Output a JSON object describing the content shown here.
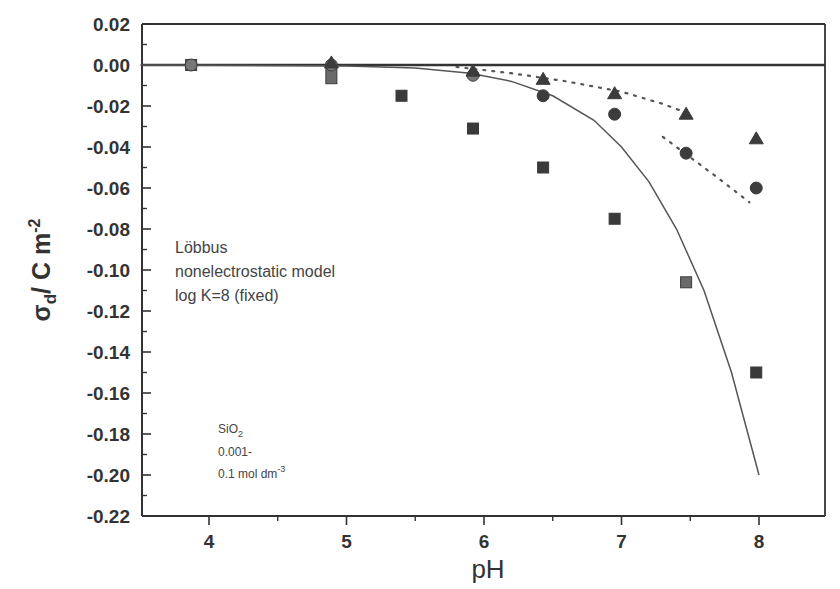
{
  "chart_data": {
    "type": "scatter",
    "title": "",
    "xlabel": "pH",
    "ylabel": "σd / C m-2",
    "ylabel_parts": {
      "sigma": "σ",
      "sub": "d",
      "unit": "/ C m",
      "sup": "-2"
    },
    "xlim": [
      3.5,
      8.5
    ],
    "ylim": [
      -0.22,
      0.02
    ],
    "grid": false,
    "x_ticks": [
      4,
      5,
      6,
      7,
      8
    ],
    "x_tick_labels": [
      "4",
      "5",
      "6",
      "7",
      "8"
    ],
    "y_ticks": [
      0.02,
      0.0,
      -0.02,
      -0.04,
      -0.06,
      -0.08,
      -0.1,
      -0.12,
      -0.14,
      -0.16,
      -0.18,
      -0.2,
      -0.22
    ],
    "y_tick_labels": [
      "0.02",
      "0.00",
      "-0.02",
      "-0.04",
      "-0.06",
      "-0.08",
      "-0.10",
      "-0.12",
      "-0.14",
      "-0.16",
      "-0.18",
      "-0.20",
      "-0.22"
    ],
    "annotations": [
      {
        "lines": [
          "Löbbus",
          "nonelectrostatic model",
          "log K=8 (fixed)"
        ]
      },
      {
        "lines": [
          "SiO2",
          "0.001-",
          "0.1 mol dm-3"
        ]
      }
    ],
    "series": [
      {
        "name": "squares (highest concentration)",
        "marker": "square",
        "x": [
          3.87,
          4.89,
          5.4,
          5.92,
          6.43,
          6.95,
          7.47,
          7.98
        ],
        "y": [
          0.0,
          -0.004,
          -0.015,
          -0.031,
          -0.05,
          -0.075,
          -0.106,
          -0.15
        ]
      },
      {
        "name": "circles (intermediate concentration)",
        "marker": "circle",
        "x": [
          3.87,
          4.89,
          5.92,
          6.43,
          6.95,
          7.47,
          7.98
        ],
        "y": [
          0.0,
          0.0,
          -0.005,
          -0.015,
          -0.024,
          -0.043,
          -0.06
        ]
      },
      {
        "name": "triangles (lowest concentration)",
        "marker": "triangle",
        "x": [
          4.89,
          5.92,
          6.43,
          6.95,
          7.47,
          7.98
        ],
        "y": [
          0.001,
          -0.003,
          -0.007,
          -0.014,
          -0.024,
          -0.036
        ]
      },
      {
        "name": "model (solid)",
        "line": "solid",
        "x": [
          3.5,
          5.0,
          5.5,
          5.9,
          6.2,
          6.5,
          6.8,
          7.0,
          7.2,
          7.4,
          7.6,
          7.8,
          8.0
        ],
        "y": [
          0.0,
          -0.0005,
          -0.0015,
          -0.004,
          -0.008,
          -0.015,
          -0.027,
          -0.04,
          -0.057,
          -0.08,
          -0.11,
          -0.15,
          -0.2
        ]
      },
      {
        "name": "model (dotted, upper)",
        "line": "dotted",
        "x": [
          5.8,
          6.2,
          6.6,
          7.0,
          7.3,
          7.5
        ],
        "y": [
          -0.001,
          -0.004,
          -0.008,
          -0.013,
          -0.019,
          -0.024
        ]
      },
      {
        "name": "model (dotted, lower)",
        "line": "dotted",
        "x": [
          7.3,
          7.5,
          7.7,
          7.93
        ],
        "y": [
          -0.035,
          -0.045,
          -0.055,
          -0.067
        ]
      }
    ],
    "reference_line": {
      "y": 0.0,
      "style": "solid-thick"
    }
  },
  "legend_text": {
    "line1": "Löbbus",
    "line2": "nonelectrostatic model",
    "line3": "log K=8 (fixed)"
  },
  "sample_text": {
    "formula_main": "SiO",
    "formula_sub": "2",
    "line2": "0.001-",
    "line3_main": "0.1 mol dm",
    "line3_sup": "-3"
  },
  "colors": {
    "axis": "#333333",
    "square": "#3a3a3a",
    "square_light": "#6a6a6a",
    "circle": "#3c3c3c",
    "triangle": "#3c3c3c",
    "curve": "#555555"
  }
}
